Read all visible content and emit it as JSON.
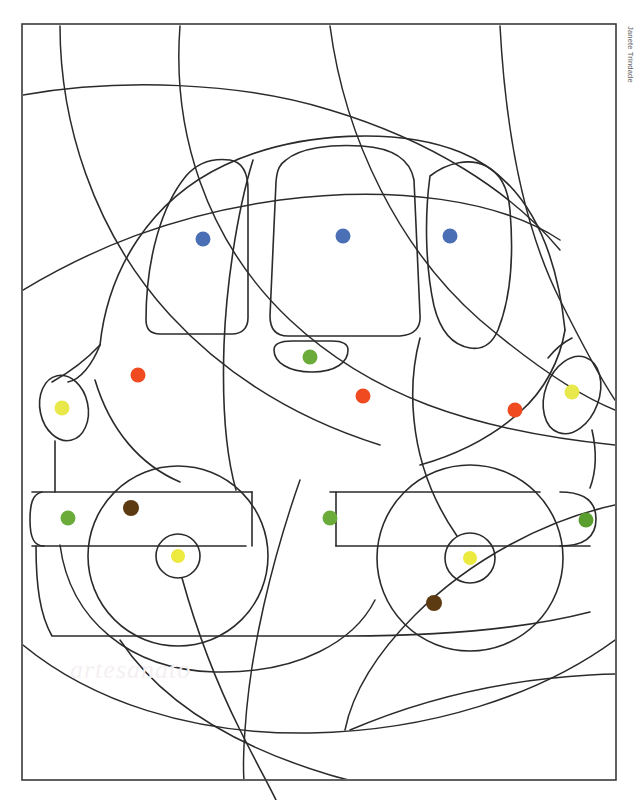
{
  "page": {
    "background_color": "#ffffff",
    "width": 640,
    "height": 800
  },
  "credit": {
    "text": "Janete Trindade",
    "color": "#5d5d5d",
    "orientation": "vertical-right"
  },
  "watermark": {
    "text": "artesanato",
    "color": "#f4f0f2"
  },
  "frame": {
    "name": "page-border",
    "stroke": "#3a3a3a",
    "stroke_width": 1.6,
    "x": 22,
    "y": 24,
    "width": 594,
    "height": 756
  },
  "line_art": {
    "stroke": "#2b2b2b",
    "stroke_width": 1.5,
    "fill": "none",
    "subject": "cartoon car / van front three-quarter view",
    "regions": [
      "background-swirl-arcs",
      "car-body",
      "roof",
      "left-window",
      "center-windshield",
      "right-window",
      "grille",
      "left-headlight",
      "right-headlight",
      "left-bumper-panel",
      "right-bumper-panel",
      "center-bumper-bar",
      "left-wheel",
      "right-wheel",
      "left-hubcap",
      "right-hubcap"
    ]
  },
  "palette": {
    "blue": "#4b6fb5",
    "orange": "#f04b20",
    "yellow_light": "#e8e84a",
    "yellow_hub": "#ece93f",
    "green": "#6aab3a",
    "green_dark": "#5a9e2e",
    "brown": "#5c3a12",
    "olive": "#6f6a18"
  },
  "color_dots": [
    {
      "id": "dot-left-window",
      "cx": 203,
      "cy": 239,
      "r": 7.5,
      "color_name": "blue",
      "color": "#4b6fb5"
    },
    {
      "id": "dot-center-windshield",
      "cx": 343,
      "cy": 236,
      "r": 7.5,
      "color_name": "blue",
      "color": "#4b6fb5"
    },
    {
      "id": "dot-right-window",
      "cx": 450,
      "cy": 236,
      "r": 7.5,
      "color_name": "blue",
      "color": "#4b6fb5"
    },
    {
      "id": "dot-hood-left",
      "cx": 138,
      "cy": 375,
      "r": 7.5,
      "color_name": "orange",
      "color": "#f04b20"
    },
    {
      "id": "dot-grille",
      "cx": 310,
      "cy": 357,
      "r": 7.5,
      "color_name": "green",
      "color": "#6aab3a"
    },
    {
      "id": "dot-hood-center",
      "cx": 363,
      "cy": 396,
      "r": 7.5,
      "color_name": "orange",
      "color": "#f04b20"
    },
    {
      "id": "dot-hood-right",
      "cx": 515,
      "cy": 410,
      "r": 7.5,
      "color_name": "orange",
      "color": "#f04b20"
    },
    {
      "id": "dot-headlight-left",
      "cx": 62,
      "cy": 408,
      "r": 7.5,
      "color_name": "yellow",
      "color": "#e8e84a"
    },
    {
      "id": "dot-headlight-right",
      "cx": 572,
      "cy": 392,
      "r": 7.5,
      "color_name": "yellow",
      "color": "#e8e84a"
    },
    {
      "id": "dot-bumper-left",
      "cx": 68,
      "cy": 518,
      "r": 7.5,
      "color_name": "green",
      "color": "#6aab3a"
    },
    {
      "id": "dot-bumper-center",
      "cx": 330,
      "cy": 518,
      "r": 7.5,
      "color_name": "green",
      "color": "#6aab3a"
    },
    {
      "id": "dot-bumper-right",
      "cx": 586,
      "cy": 520,
      "r": 7.5,
      "color_name": "green",
      "color": "#5a9e2e"
    },
    {
      "id": "dot-wheel-left-tire",
      "cx": 131,
      "cy": 508,
      "r": 8.0,
      "color_name": "brown",
      "color": "#5c3a12"
    },
    {
      "id": "dot-wheel-right-tire",
      "cx": 434,
      "cy": 603,
      "r": 8.0,
      "color_name": "brown",
      "color": "#5c3a12"
    },
    {
      "id": "dot-hub-left",
      "cx": 178,
      "cy": 556,
      "r": 7.0,
      "color_name": "yellow",
      "color": "#ece93f"
    },
    {
      "id": "dot-hub-right",
      "cx": 470,
      "cy": 558,
      "r": 7.0,
      "color_name": "yellow",
      "color": "#ece93f"
    }
  ],
  "legend": {
    "instruction": "",
    "dot_count": 16
  }
}
